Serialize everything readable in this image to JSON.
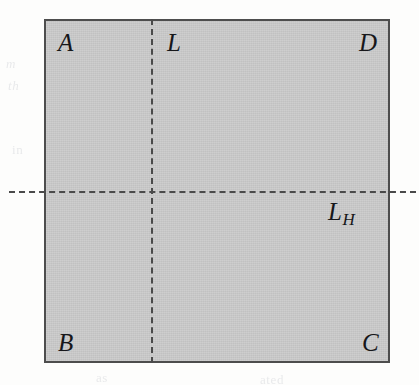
{
  "figure": {
    "type": "geometry-diagram",
    "shape": {
      "name": "shaded-rectangle",
      "fill_color": "#c9c9c9",
      "border_color": "#4d4d4d"
    },
    "lines": [
      {
        "name": "vertical-dashed-line",
        "orientation": "vertical",
        "style": "dashed",
        "color": "#4a4a4a",
        "label": "L"
      },
      {
        "name": "horizontal-dashed-line",
        "orientation": "horizontal",
        "style": "dashed",
        "color": "#4a4a4a",
        "label_base": "L",
        "label_subscript": "H"
      }
    ],
    "vertices": [
      {
        "id": "A",
        "label": "A",
        "position": "top-left"
      },
      {
        "id": "D",
        "label": "D",
        "position": "top-right"
      },
      {
        "id": "B",
        "label": "B",
        "position": "bottom-left"
      },
      {
        "id": "C",
        "label": "C",
        "position": "bottom-right"
      }
    ],
    "line_labels": {
      "vertical": "L",
      "horizontal_base": "L",
      "horizontal_subscript": "H"
    },
    "background_color": "#fdfdfc"
  },
  "bleed_through": [
    {
      "text": "m"
    },
    {
      "text": "th"
    },
    {
      "text": "vertical"
    },
    {
      "text": "and"
    },
    {
      "text": "the"
    },
    {
      "text": "in"
    },
    {
      "text": "of"
    },
    {
      "text": "as"
    },
    {
      "text": "ated"
    }
  ]
}
